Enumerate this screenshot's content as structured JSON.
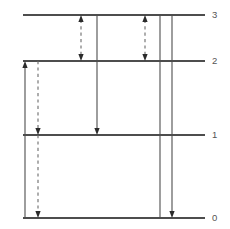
{
  "chart_data": {
    "type": "diagram",
    "title": "",
    "subtitle": "",
    "xlabel": "",
    "ylabel": "",
    "grid": false,
    "legend": "none",
    "geometry": {
      "width": 230,
      "height": 229,
      "line_x_start": 23,
      "line_x_end": 205,
      "label_x": 212
    },
    "levels": [
      {
        "label": "3",
        "y": 15,
        "value": 3
      },
      {
        "label": "2",
        "y": 61,
        "value": 2
      },
      {
        "label": "1",
        "y": 135,
        "value": 1
      },
      {
        "label": "0",
        "y": 218,
        "value": 0
      }
    ],
    "transitions": [
      {
        "id": "t1",
        "x": 25,
        "from_level": 0,
        "to_level": 2,
        "y_from": 218,
        "y_to": 61,
        "style": "solid",
        "direction": "up",
        "heads": "end"
      },
      {
        "id": "t2",
        "x": 38,
        "from_level": 2,
        "to_level": 1,
        "y_from": 61,
        "y_to": 135,
        "style": "dashed",
        "direction": "down",
        "heads": "end"
      },
      {
        "id": "t3",
        "x": 38,
        "from_level": 1,
        "to_level": 0,
        "y_from": 135,
        "y_to": 218,
        "style": "dashed",
        "direction": "down",
        "heads": "end"
      },
      {
        "id": "t4",
        "x": 81,
        "from_level": 2,
        "to_level": 3,
        "y_from": 61,
        "y_to": 15,
        "style": "dashed",
        "direction": "both",
        "heads": "both"
      },
      {
        "id": "t5",
        "x": 97,
        "from_level": 3,
        "to_level": 1,
        "y_from": 15,
        "y_to": 135,
        "style": "solid",
        "direction": "down",
        "heads": "end"
      },
      {
        "id": "t6",
        "x": 145,
        "from_level": 2,
        "to_level": 3,
        "y_from": 61,
        "y_to": 15,
        "style": "dashed",
        "direction": "both",
        "heads": "both"
      },
      {
        "id": "t7",
        "x": 160,
        "from_level": 0,
        "to_level": 3,
        "y_from": 218,
        "y_to": 15,
        "style": "solid",
        "direction": "up",
        "heads": "none"
      },
      {
        "id": "t8",
        "x": 172,
        "from_level": 3,
        "to_level": 0,
        "y_from": 15,
        "y_to": 218,
        "style": "solid",
        "direction": "down",
        "heads": "end"
      }
    ],
    "colors": {
      "level_line": "#4d4d4d",
      "solid_arrow": "#4d4d4d",
      "dashed_arrow": "#6b6b6b",
      "arrow_head": "#2b2b2b",
      "label_text": "#555555",
      "background": "#ffffff"
    }
  }
}
